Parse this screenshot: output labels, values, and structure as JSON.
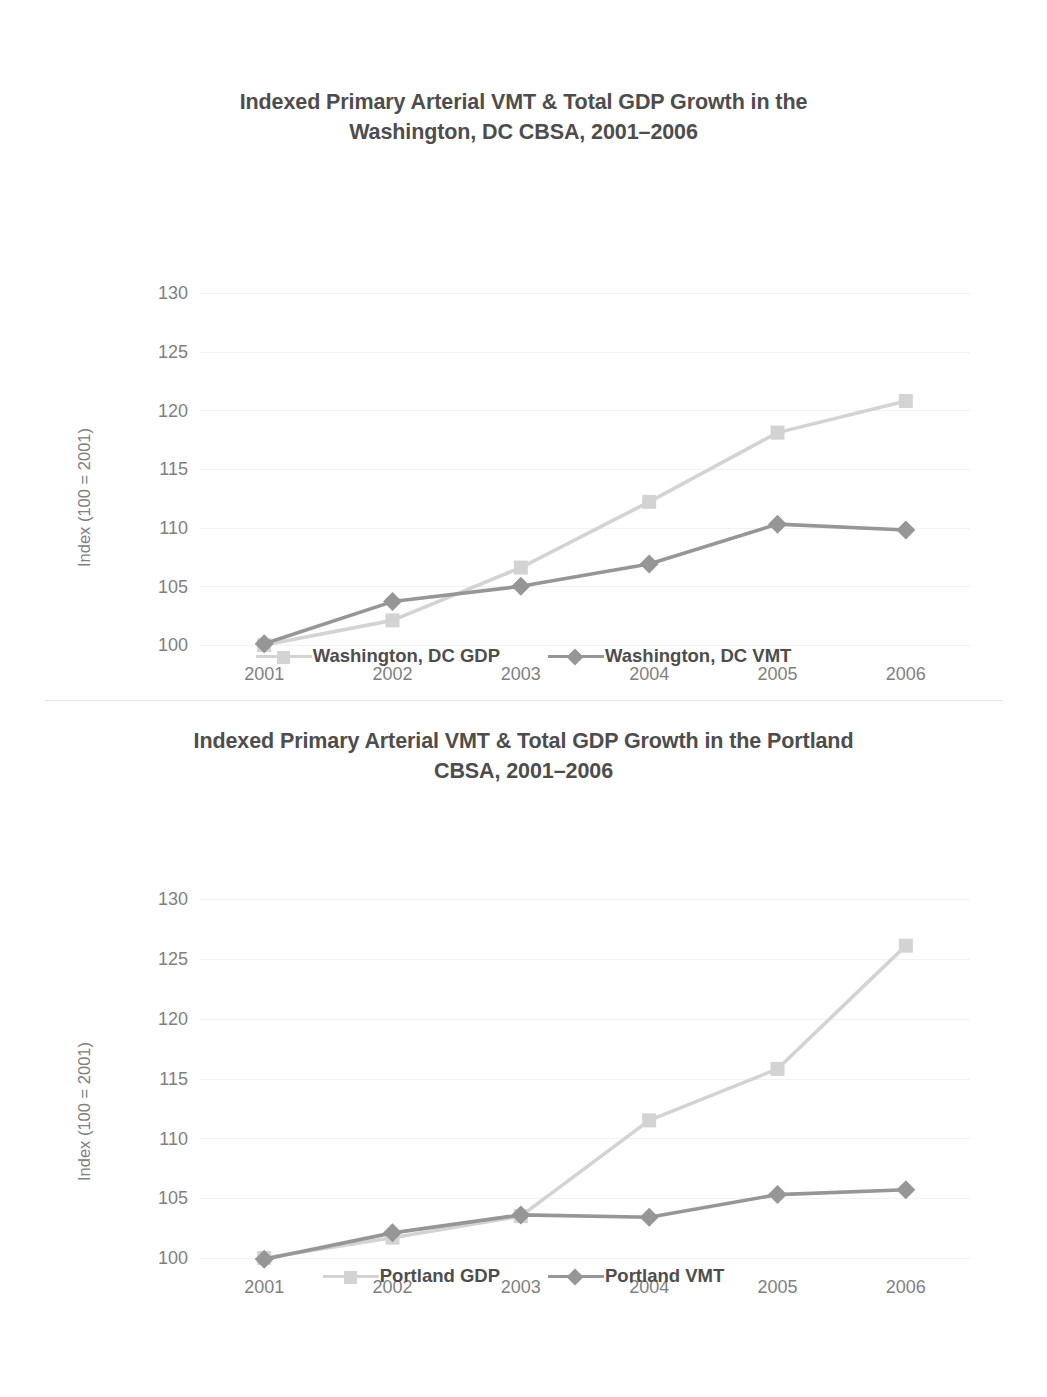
{
  "document": {
    "background": "#ffffff",
    "series_colors": {
      "gdp": "#d3d3d3",
      "vmt": "#969696"
    },
    "text_colors": {
      "title": "#4d4d4d",
      "tick": "#7f7f7f",
      "axis_title": "#808080",
      "gridline": "#f2f2f2"
    }
  },
  "charts": [
    {
      "id": "washington-dc",
      "title": "Indexed Primary Arterial VMT & Total GDP Growth in the Washington, DC CBSA, 2001–2006",
      "title_line1": "Indexed Primary Arterial VMT & Total GDP Growth in the",
      "title_line2": "Washington, DC CBSA, 2001–2006",
      "ylabel": "Index (100 = 2001)",
      "xlabel": "",
      "yticks": [
        "130",
        "125",
        "120",
        "115",
        "110",
        "105",
        "100"
      ],
      "xticks": [
        "2001",
        "2002",
        "2003",
        "2004",
        "2005",
        "2006"
      ],
      "legend": [
        {
          "label": "Washington, DC GDP",
          "marker": "square",
          "color": "#d3d3d3"
        },
        {
          "label": "Washington, DC VMT",
          "marker": "diamond",
          "color": "#969696"
        }
      ]
    },
    {
      "id": "portland",
      "title": "Indexed Primary Arterial VMT & Total GDP Growth in the Portland CBSA, 2001–2006",
      "title_line1": "Indexed Primary Arterial VMT & Total GDP Growth in the Portland",
      "title_line2": "CBSA, 2001–2006",
      "ylabel": "Index (100 = 2001)",
      "xlabel": "",
      "yticks": [
        "130",
        "125",
        "120",
        "115",
        "110",
        "105",
        "100"
      ],
      "xticks": [
        "2001",
        "2002",
        "2003",
        "2004",
        "2005",
        "2006"
      ],
      "legend": [
        {
          "label": "Portland GDP",
          "marker": "square",
          "color": "#d3d3d3"
        },
        {
          "label": "Portland VMT",
          "marker": "diamond",
          "color": "#969696"
        }
      ]
    }
  ],
  "chart_data": [
    {
      "type": "line",
      "title": "Indexed Primary Arterial VMT & Total GDP Growth in the Washington, DC CBSA, 2001–2006",
      "xlabel": "",
      "ylabel": "Index (100 = 2001)",
      "categories": [
        "2001",
        "2002",
        "2003",
        "2004",
        "2005",
        "2006"
      ],
      "x": [
        2001,
        2002,
        2003,
        2004,
        2005,
        2006
      ],
      "ylim": [
        100,
        130
      ],
      "yticks": [
        100,
        105,
        110,
        115,
        120,
        125,
        130
      ],
      "grid": true,
      "legend_position": "bottom",
      "series": [
        {
          "name": "Washington, DC GDP",
          "color": "#d3d3d3",
          "marker": "square",
          "values": [
            100.0,
            102.1,
            106.6,
            112.2,
            118.1,
            120.8
          ]
        },
        {
          "name": "Washington, DC VMT",
          "color": "#969696",
          "marker": "diamond",
          "values": [
            100.1,
            103.7,
            105.0,
            106.9,
            110.3,
            109.8
          ]
        }
      ]
    },
    {
      "type": "line",
      "title": "Indexed Primary Arterial VMT & Total GDP Growth in the Portland CBSA, 2001–2006",
      "xlabel": "",
      "ylabel": "Index (100 = 2001)",
      "categories": [
        "2001",
        "2002",
        "2003",
        "2004",
        "2005",
        "2006"
      ],
      "x": [
        2001,
        2002,
        2003,
        2004,
        2005,
        2006
      ],
      "ylim": [
        100,
        130
      ],
      "yticks": [
        100,
        105,
        110,
        115,
        120,
        125,
        130
      ],
      "grid": true,
      "legend_position": "bottom",
      "series": [
        {
          "name": "Portland GDP",
          "color": "#d3d3d3",
          "marker": "square",
          "values": [
            100.0,
            101.7,
            103.5,
            111.5,
            115.8,
            126.1
          ]
        },
        {
          "name": "Portland VMT",
          "color": "#969696",
          "marker": "diamond",
          "values": [
            99.9,
            102.1,
            103.6,
            103.4,
            105.3,
            105.7
          ]
        }
      ]
    }
  ]
}
